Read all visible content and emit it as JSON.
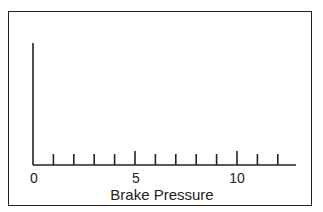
{
  "chart_data": {
    "type": "line",
    "title": "",
    "xlabel": "Brake Pressure",
    "ylabel": "",
    "x_ticks_labeled": [
      "0",
      "5",
      "10"
    ],
    "x_ticks_minor": [
      0,
      1,
      2,
      3,
      4,
      5,
      6,
      7,
      8,
      9,
      10,
      11,
      12
    ],
    "xlim": [
      0,
      12.8
    ],
    "series": [],
    "grid": false,
    "note": "Empty axes: vertical y-axis without labels, horizontal x-axis with ticks 0-12, major ticks at 0, 5, 10"
  },
  "axis": {
    "x_label": "Brake Pressure",
    "tick_0": "0",
    "tick_5": "5",
    "tick_10": "10"
  }
}
